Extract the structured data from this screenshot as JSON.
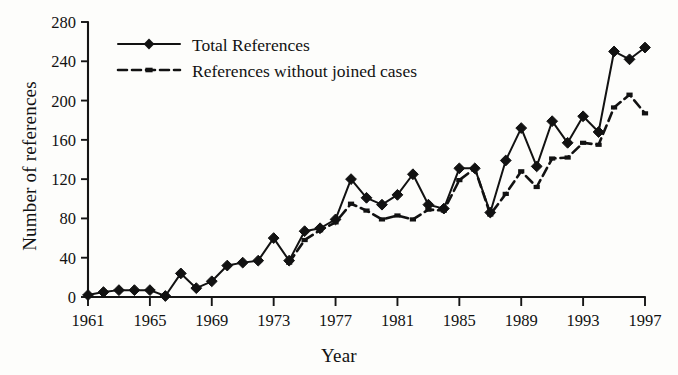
{
  "chart_data": {
    "type": "line",
    "title": "",
    "xlabel": "Year",
    "ylabel": "Number of references",
    "xlim": [
      1961,
      1997
    ],
    "ylim": [
      0,
      280
    ],
    "yticks": [
      0,
      40,
      80,
      120,
      160,
      200,
      240,
      280
    ],
    "xticks": [
      1961,
      1965,
      1969,
      1973,
      1977,
      1981,
      1985,
      1989,
      1993,
      1997
    ],
    "grid": false,
    "legend_position": "top-left",
    "x": [
      1961,
      1962,
      1963,
      1964,
      1965,
      1966,
      1967,
      1968,
      1969,
      1970,
      1971,
      1972,
      1973,
      1974,
      1975,
      1976,
      1977,
      1978,
      1979,
      1980,
      1981,
      1982,
      1983,
      1984,
      1985,
      1986,
      1987,
      1988,
      1989,
      1990,
      1991,
      1992,
      1993,
      1994,
      1995,
      1996,
      1997
    ],
    "series": [
      {
        "name": "Total References",
        "style": "solid",
        "marker": "diamond",
        "color": "#121212",
        "values": [
          2,
          5,
          7,
          7,
          7,
          1,
          24,
          9,
          16,
          32,
          35,
          37,
          60,
          37,
          67,
          70,
          79,
          120,
          101,
          94,
          104,
          125,
          94,
          90,
          131,
          131,
          86,
          139,
          172,
          133,
          179,
          157,
          184,
          168,
          250,
          242,
          254
        ]
      },
      {
        "name": "References without joined cases",
        "style": "dashed",
        "marker": "square",
        "color": "#121212",
        "values": [
          null,
          null,
          null,
          null,
          null,
          null,
          null,
          null,
          null,
          null,
          null,
          null,
          null,
          35,
          58,
          68,
          76,
          95,
          88,
          79,
          83,
          79,
          89,
          88,
          119,
          131,
          84,
          105,
          128,
          112,
          141,
          142,
          157,
          155,
          193,
          206,
          187
        ]
      }
    ],
    "legend": [
      {
        "label": "Total References",
        "style": "solid",
        "marker": "diamond"
      },
      {
        "label": "References without joined cases",
        "style": "dashed",
        "marker": "square"
      }
    ]
  }
}
